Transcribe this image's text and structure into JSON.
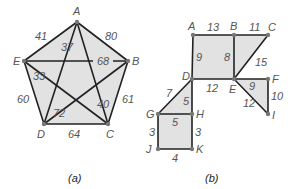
{
  "figures": [
    {
      "id": "a",
      "caption": "(a)",
      "type": "complete-graph-pentagon",
      "vertices": {
        "A": {
          "label": "A",
          "x": 77,
          "y": 22
        },
        "B": {
          "label": "B",
          "x": 128,
          "y": 61
        },
        "C": {
          "label": "C",
          "x": 108,
          "y": 124
        },
        "D": {
          "label": "D",
          "x": 44,
          "y": 124
        },
        "E": {
          "label": "E",
          "x": 24,
          "y": 61
        }
      },
      "edges": [
        {
          "from": "A",
          "to": "E",
          "weight": "41"
        },
        {
          "from": "A",
          "to": "B",
          "weight": "80"
        },
        {
          "from": "A",
          "to": "D",
          "weight": "37"
        },
        {
          "from": "A",
          "to": "C",
          "weight": "40"
        },
        {
          "from": "E",
          "to": "B",
          "weight": "68"
        },
        {
          "from": "E",
          "to": "C",
          "weight": "33"
        },
        {
          "from": "E",
          "to": "D",
          "weight": "60"
        },
        {
          "from": "B",
          "to": "D",
          "weight": "72"
        },
        {
          "from": "B",
          "to": "C",
          "weight": "61"
        },
        {
          "from": "D",
          "to": "C",
          "weight": "64"
        }
      ]
    },
    {
      "id": "b",
      "caption": "(b)",
      "type": "weighted-graph",
      "vertices": {
        "A": {
          "label": "A",
          "x": 193,
          "y": 35
        },
        "B": {
          "label": "B",
          "x": 234,
          "y": 35
        },
        "C": {
          "label": "C",
          "x": 268,
          "y": 35
        },
        "D": {
          "label": "D",
          "x": 192,
          "y": 79
        },
        "E": {
          "label": "E",
          "x": 234,
          "y": 79
        },
        "F": {
          "label": "F",
          "x": 268,
          "y": 79
        },
        "G": {
          "label": "G",
          "x": 158,
          "y": 114
        },
        "H": {
          "label": "H",
          "x": 192,
          "y": 114
        },
        "I": {
          "label": "I",
          "x": 268,
          "y": 114
        },
        "J": {
          "label": "J",
          "x": 158,
          "y": 149
        },
        "K": {
          "label": "K",
          "x": 192,
          "y": 149
        }
      },
      "edges": [
        {
          "from": "A",
          "to": "B",
          "weight": "13"
        },
        {
          "from": "B",
          "to": "C",
          "weight": "11"
        },
        {
          "from": "A",
          "to": "D",
          "weight": "9"
        },
        {
          "from": "B",
          "to": "E",
          "weight": "8"
        },
        {
          "from": "C",
          "to": "E",
          "weight": "15"
        },
        {
          "from": "D",
          "to": "E",
          "weight": "12"
        },
        {
          "from": "E",
          "to": "F",
          "weight": "9"
        },
        {
          "from": "F",
          "to": "I",
          "weight": "10"
        },
        {
          "from": "E",
          "to": "I",
          "weight": "12"
        },
        {
          "from": "D",
          "to": "G",
          "weight": "7"
        },
        {
          "from": "D",
          "to": "H",
          "weight": "5"
        },
        {
          "from": "G",
          "to": "H",
          "weight": "5"
        },
        {
          "from": "G",
          "to": "J",
          "weight": "3"
        },
        {
          "from": "H",
          "to": "K",
          "weight": "3"
        },
        {
          "from": "J",
          "to": "K",
          "weight": "4"
        }
      ]
    }
  ],
  "text": {
    "a_caption": "(a)",
    "b_caption": "(b)",
    "a_A": "A",
    "a_B": "B",
    "a_C": "C",
    "a_D": "D",
    "a_E": "E",
    "a_w_AE": "41",
    "a_w_AB": "80",
    "a_w_AD": "37",
    "a_w_AC": "40",
    "a_w_EB": "68",
    "a_w_EC": "33",
    "a_w_ED": "60",
    "a_w_BD": "72",
    "a_w_BC": "61",
    "a_w_DC": "64",
    "b_A": "A",
    "b_B": "B",
    "b_C": "C",
    "b_D": "D",
    "b_E": "E",
    "b_F": "F",
    "b_G": "G",
    "b_H": "H",
    "b_I": "I",
    "b_J": "J",
    "b_K": "K",
    "b_w_AB": "13",
    "b_w_BC": "11",
    "b_w_AD": "9",
    "b_w_BE": "8",
    "b_w_CE": "15",
    "b_w_DE": "12",
    "b_w_EF": "9",
    "b_w_FI": "10",
    "b_w_EI": "12",
    "b_w_DG": "7",
    "b_w_DH": "5",
    "b_w_GH": "5",
    "b_w_GJ": "3",
    "b_w_HK": "3",
    "b_w_JK": "4"
  }
}
